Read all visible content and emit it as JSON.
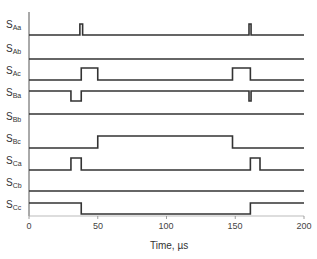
{
  "chart_data": {
    "type": "line",
    "title": "",
    "xlabel": "Time, µs",
    "ylabel": "",
    "xlim": [
      0,
      200
    ],
    "x_ticks": [
      0,
      50,
      100,
      150,
      200
    ],
    "grid": false,
    "legend": "none",
    "style": "digital timing diagram (step waveforms)",
    "series": [
      {
        "name": "SAa",
        "label_main": "S",
        "label_sub": "Aa",
        "initial": 0,
        "transitions": [
          [
            37,
            1
          ],
          [
            39,
            0
          ],
          [
            160,
            1
          ],
          [
            161.5,
            0
          ]
        ]
      },
      {
        "name": "SAb",
        "label_main": "S",
        "label_sub": "Ab",
        "initial": 0,
        "transitions": []
      },
      {
        "name": "SAc",
        "label_main": "S",
        "label_sub": "Ac",
        "initial": 0,
        "transitions": [
          [
            38,
            1
          ],
          [
            50,
            0
          ],
          [
            148,
            1
          ],
          [
            161,
            0
          ]
        ]
      },
      {
        "name": "SBa",
        "label_main": "S",
        "label_sub": "Ba",
        "initial": 1,
        "transitions": [
          [
            30.5,
            0
          ],
          [
            38,
            1
          ],
          [
            160,
            0
          ],
          [
            161.5,
            1
          ]
        ]
      },
      {
        "name": "SBb",
        "label_main": "S",
        "label_sub": "Bb",
        "initial": 1,
        "transitions": []
      },
      {
        "name": "SBc",
        "label_main": "S",
        "label_sub": "Bc",
        "initial": 0,
        "transitions": [
          [
            50,
            1
          ],
          [
            148,
            0
          ]
        ]
      },
      {
        "name": "SCa",
        "label_main": "S",
        "label_sub": "Ca",
        "initial": 0,
        "transitions": [
          [
            30.5,
            1
          ],
          [
            38,
            0
          ],
          [
            161,
            1
          ],
          [
            168,
            0
          ]
        ]
      },
      {
        "name": "SCb",
        "label_main": "S",
        "label_sub": "Cb",
        "initial": 1,
        "transitions": []
      },
      {
        "name": "SCc",
        "label_main": "S",
        "label_sub": "Cc",
        "initial": 1,
        "transitions": [
          [
            38,
            0
          ],
          [
            161,
            1
          ]
        ]
      }
    ]
  },
  "layout": {
    "x0_px": 29,
    "x200_px": 304,
    "rows": [
      {
        "low": 35,
        "high": 24,
        "label_y": 20
      },
      {
        "low": 59,
        "high": 48,
        "label_y": 44
      },
      {
        "low": 80,
        "high": 68,
        "label_y": 66
      },
      {
        "low": 101,
        "high": 91,
        "label_y": 88
      },
      {
        "low": 125,
        "high": 114,
        "label_y": 112
      },
      {
        "low": 148,
        "high": 136,
        "label_y": 134
      },
      {
        "low": 170,
        "high": 158,
        "label_y": 156
      },
      {
        "low": 202,
        "high": 191,
        "label_y": 178
      },
      {
        "low": 214,
        "high": 203,
        "label_y": 200
      }
    ],
    "line_color": "#333333",
    "axis_color": "#555555"
  }
}
